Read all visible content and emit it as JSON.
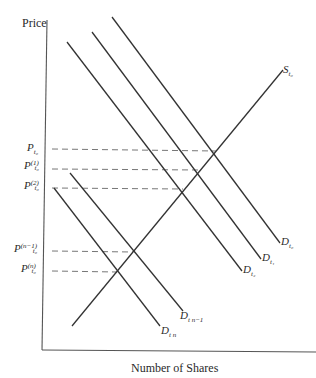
{
  "diagram": {
    "y_axis_label": "Price",
    "x_axis_label": "Number of Shares",
    "price_levels": [
      {
        "base": "P",
        "sup": "",
        "sub": "t₀",
        "y": 149
      },
      {
        "base": "P",
        "sup": "(1)",
        "sub": "t₀",
        "y": 169
      },
      {
        "base": "P",
        "sup": "(2)",
        "sub": "t₀",
        "y": 188
      },
      {
        "base": "P",
        "sup": "(n−1)",
        "sub": "t₀",
        "y": 251
      },
      {
        "base": "P",
        "sup": "(n)",
        "sub": "t₀",
        "y": 271
      }
    ],
    "curves": [
      {
        "name": "S",
        "sub": "t₀",
        "type": "supply"
      },
      {
        "name": "D",
        "sub": "t₀",
        "type": "demand"
      },
      {
        "name": "D",
        "sub": "t₁",
        "type": "demand"
      },
      {
        "name": "D",
        "sub": "t₂",
        "type": "demand"
      },
      {
        "name": "D",
        "sub": "t n−1",
        "type": "demand"
      },
      {
        "name": "D",
        "sub": "t n",
        "type": "demand"
      }
    ],
    "colors": {
      "line": "#333333",
      "dash": "#555555",
      "background": "#ffffff"
    }
  }
}
